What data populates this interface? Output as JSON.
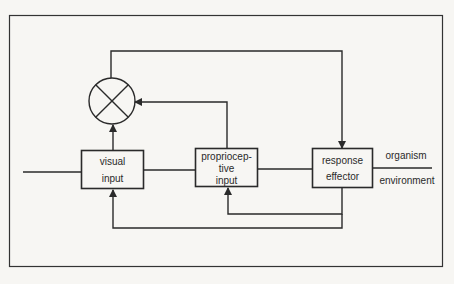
{
  "diagram": {
    "type": "block-diagram",
    "colors": {
      "background": "#f7f6f3",
      "stroke": "#2a2a2a",
      "text": "#2a2a2a"
    },
    "comparator": {
      "symbol": "summing-junction-x-circle"
    },
    "blocks": [
      {
        "id": "visual",
        "line1": "visual",
        "line2": "input"
      },
      {
        "id": "proprio",
        "line1": "propriocep-",
        "line2": "tive",
        "line3": "input"
      },
      {
        "id": "response",
        "line1": "response",
        "line2": "effector"
      }
    ],
    "boundary": {
      "above": "organism",
      "below": "environment"
    }
  }
}
